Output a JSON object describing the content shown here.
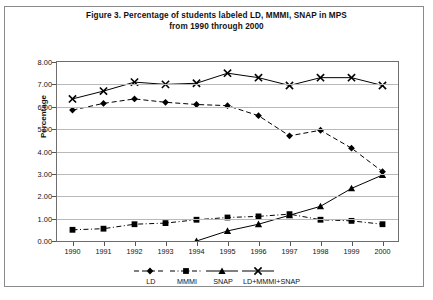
{
  "figure": {
    "title_line1": "Figure 3. Percentage of students labeled LD, MMMI, SNAP in MPS",
    "title_line2": "from 1990 through 2000"
  },
  "axes": {
    "ylabel": "Percentage",
    "y_ticks": [
      "0.00",
      "1.00",
      "2.00",
      "3.00",
      "4.00",
      "5.00",
      "6.00",
      "7.00",
      "8.00"
    ],
    "x_ticks": [
      "1990",
      "1991",
      "1992",
      "1993",
      "1994",
      "1995",
      "1996",
      "1997",
      "1998",
      "1999",
      "2000"
    ]
  },
  "legend": {
    "items": [
      {
        "label": "LD",
        "marker": "diamond",
        "dash": "dashed",
        "color": "#000000"
      },
      {
        "label": "MMMI",
        "marker": "square",
        "dash": "dash-dot",
        "color": "#000000"
      },
      {
        "label": "SNAP",
        "marker": "triangle",
        "dash": "solid",
        "color": "#000000"
      },
      {
        "label": "LD+MMMI+SNAP",
        "marker": "cross",
        "dash": "solid",
        "color": "#000000"
      }
    ]
  },
  "chart_data": {
    "type": "line",
    "title": "Figure 3. Percentage of students labeled LD, MMMI, SNAP in MPS from 1990 through 2000",
    "xlabel": "",
    "ylabel": "Percentage",
    "ylim": [
      0,
      8
    ],
    "ytick_step": 1,
    "grid": true,
    "legend_position": "bottom",
    "categories": [
      "1990",
      "1991",
      "1992",
      "1993",
      "1994",
      "1995",
      "1996",
      "1997",
      "1998",
      "1999",
      "2000"
    ],
    "series": [
      {
        "name": "LD",
        "marker": "diamond",
        "dash": "dashed",
        "values": [
          5.85,
          6.15,
          6.35,
          6.2,
          6.1,
          6.05,
          5.6,
          4.7,
          4.95,
          4.15,
          3.1
        ]
      },
      {
        "name": "MMMI",
        "marker": "square",
        "dash": "dash-dot",
        "values": [
          0.5,
          0.55,
          0.75,
          0.8,
          0.95,
          1.05,
          1.1,
          1.2,
          0.95,
          0.9,
          0.75
        ]
      },
      {
        "name": "SNAP",
        "marker": "triangle",
        "dash": "solid",
        "values": [
          null,
          null,
          null,
          null,
          0.0,
          0.45,
          0.75,
          1.15,
          1.55,
          2.35,
          2.95
        ]
      },
      {
        "name": "LD+MMMI+SNAP",
        "marker": "cross",
        "dash": "solid",
        "values": [
          6.35,
          6.7,
          7.1,
          7.0,
          7.05,
          7.5,
          7.3,
          6.95,
          7.3,
          7.3,
          6.95
        ]
      }
    ]
  }
}
